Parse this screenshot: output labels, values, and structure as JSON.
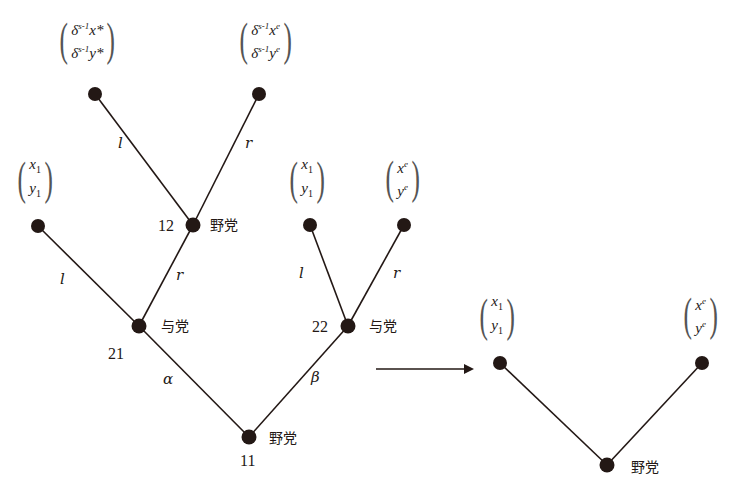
{
  "diagram": {
    "type": "game-tree",
    "left_tree": {
      "nodes": [
        {
          "id": "11",
          "label": "11",
          "player": "野党"
        },
        {
          "id": "21",
          "label": "21",
          "player": "与党"
        },
        {
          "id": "22",
          "label": "22",
          "player": "与党"
        },
        {
          "id": "12",
          "label": "12",
          "player": "野党"
        }
      ],
      "edges": {
        "alpha": "α",
        "beta": "β",
        "n21_left": "l",
        "n21_right": "r",
        "n12_left": "l",
        "n12_right": "r",
        "n22_left": "l",
        "n22_right": "r"
      },
      "payoffs": {
        "n12_l": {
          "top_prefix": "δ",
          "top_exp": "s-1",
          "top_var": "x",
          "top_mark": "*",
          "bot_prefix": "δ",
          "bot_exp": "s-1",
          "bot_var": "y",
          "bot_mark": "*"
        },
        "n12_r": {
          "top_prefix": "δ",
          "top_exp": "s-1",
          "top_var": "x",
          "top_mark": "e",
          "bot_prefix": "δ",
          "bot_exp": "s-1",
          "bot_var": "y",
          "bot_mark": "e"
        },
        "n21_l": {
          "top_var": "x",
          "top_sub": "1",
          "bot_var": "y",
          "bot_sub": "1"
        },
        "n22_l": {
          "top_var": "x",
          "top_sub": "1",
          "bot_var": "y",
          "bot_sub": "1"
        },
        "n22_r": {
          "top_var": "x",
          "top_sup": "e",
          "bot_var": "y",
          "bot_sup": "e"
        }
      }
    },
    "right_tree": {
      "root_player": "野党",
      "payoffs": {
        "left": {
          "top_var": "x",
          "top_sub": "1",
          "bot_var": "y",
          "bot_sub": "1"
        },
        "right": {
          "top_var": "x",
          "top_sup": "e",
          "bot_var": "y",
          "bot_sup": "e"
        }
      }
    },
    "colors": {
      "ink": "#231815",
      "background": "#ffffff"
    }
  }
}
